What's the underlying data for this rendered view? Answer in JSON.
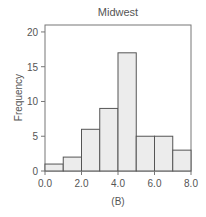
{
  "chart_data": {
    "type": "bar",
    "title": "Midwest",
    "xlabel": "",
    "ylabel": "Frequency",
    "caption": "(B)",
    "bin_edges": [
      0,
      1,
      2,
      3,
      4,
      5,
      6,
      7,
      8
    ],
    "categories": [
      "0-1",
      "1-2",
      "2-3",
      "3-4",
      "4-5",
      "5-6",
      "6-7",
      "7-8"
    ],
    "values": [
      1,
      2,
      6,
      9,
      17,
      5,
      5,
      3
    ],
    "xlim": [
      0,
      8
    ],
    "ylim": [
      0,
      21
    ],
    "x_ticks": [
      "0.0",
      "2.0",
      "4.0",
      "6.0",
      "8.0"
    ],
    "y_ticks": [
      "0",
      "5",
      "10",
      "15",
      "20"
    ],
    "grid": false,
    "legend": null,
    "bar_fill": "#ececec",
    "bar_stroke": "#555555"
  }
}
